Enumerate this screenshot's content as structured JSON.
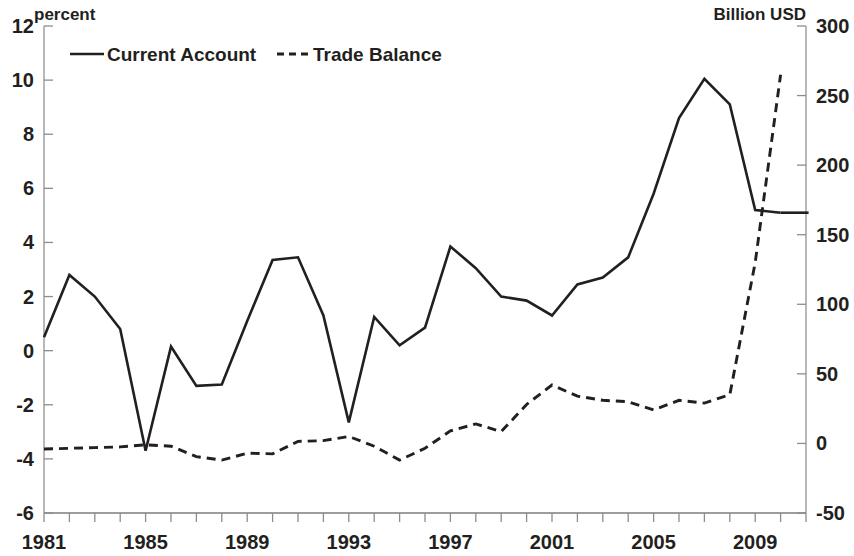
{
  "chart_data": {
    "type": "line",
    "title": "",
    "xlabel": "",
    "ylabel": "percent",
    "y2label": "Billion USD",
    "grid": false,
    "legend_position": "top-left",
    "xlim": [
      1981,
      2011
    ],
    "ylim": [
      -6,
      12
    ],
    "y2lim": [
      -50,
      300
    ],
    "x_tick_labels": [
      "1981",
      "1985",
      "1989",
      "1993",
      "1997",
      "2001",
      "2005",
      "2009"
    ],
    "x_tick_values": [
      1981,
      1985,
      1989,
      1993,
      1997,
      2001,
      2005,
      2009
    ],
    "y_tick_labels": [
      "12",
      "10",
      "8",
      "6",
      "4",
      "2",
      "0",
      "-2",
      "-4",
      "-6"
    ],
    "y_tick_values": [
      12,
      10,
      8,
      6,
      4,
      2,
      0,
      -2,
      -4,
      -6
    ],
    "y2_tick_labels": [
      "300",
      "250",
      "200",
      "150",
      "100",
      "50",
      "0",
      "-50"
    ],
    "y2_tick_values": [
      300,
      250,
      200,
      150,
      100,
      50,
      0,
      -50
    ],
    "x": [
      1981,
      1982,
      1983,
      1984,
      1985,
      1986,
      1987,
      1988,
      1989,
      1990,
      1991,
      1992,
      1993,
      1994,
      1995,
      1996,
      1997,
      1998,
      1999,
      2000,
      2001,
      2002,
      2003,
      2004,
      2005,
      2006,
      2007,
      2008,
      2009,
      2010
    ],
    "series": [
      {
        "name": "Current Account",
        "axis": "left",
        "units": "percent",
        "style": "solid",
        "values": [
          0.5,
          2.8,
          2.0,
          0.8,
          -3.7,
          0.15,
          -1.3,
          -1.25,
          1.1,
          3.35,
          3.45,
          1.3,
          -2.65,
          1.25,
          0.2,
          0.85,
          3.85,
          3.05,
          2.0,
          1.85,
          1.3,
          2.45,
          2.7,
          3.45,
          5.8,
          8.6,
          10.05,
          9.1,
          5.2,
          5.1
        ]
      },
      {
        "name": "Trade Balance",
        "axis": "right",
        "units": "Billion USD",
        "style": "dashed",
        "values": [
          -4.0,
          -3.5,
          -3.0,
          -2.5,
          -1.0,
          -2.0,
          -9.5,
          -12.0,
          -7.0,
          -7.5,
          1.5,
          2.0,
          5.0,
          -2.0,
          -12.0,
          -3.5,
          9.0,
          14.0,
          8.5,
          28.0,
          42.0,
          34.0,
          31.0,
          30.0,
          24.0,
          31.0,
          29.0,
          35.0,
          130.0,
          265.0
        ]
      }
    ]
  },
  "legend": {
    "items": [
      {
        "label": "Current Account",
        "style": "solid"
      },
      {
        "label": "Trade Balance",
        "style": "dashed"
      }
    ]
  },
  "axes": {
    "left_title": "percent",
    "right_title": "Billion USD"
  }
}
